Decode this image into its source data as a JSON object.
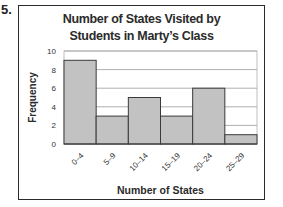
{
  "question_number": "5.",
  "chart_data": {
    "type": "bar",
    "title_lines": [
      "Number of States Visited by",
      "Students in Marty’s Class"
    ],
    "xlabel": "Number of States",
    "ylabel": "Frequency",
    "categories": [
      "0–4",
      "5–9",
      "10–14",
      "15–19",
      "20–24",
      "25–29"
    ],
    "values": [
      9,
      3,
      5,
      3,
      6,
      1
    ],
    "ylim": [
      0,
      10
    ],
    "yticks": [
      0,
      2,
      4,
      6,
      8,
      10
    ],
    "grid": true,
    "legend": null,
    "histogram": true,
    "bar_color": "#c2c2c2",
    "edge_color": "#3a3a3a",
    "grid_color": "#9a9a9a"
  }
}
